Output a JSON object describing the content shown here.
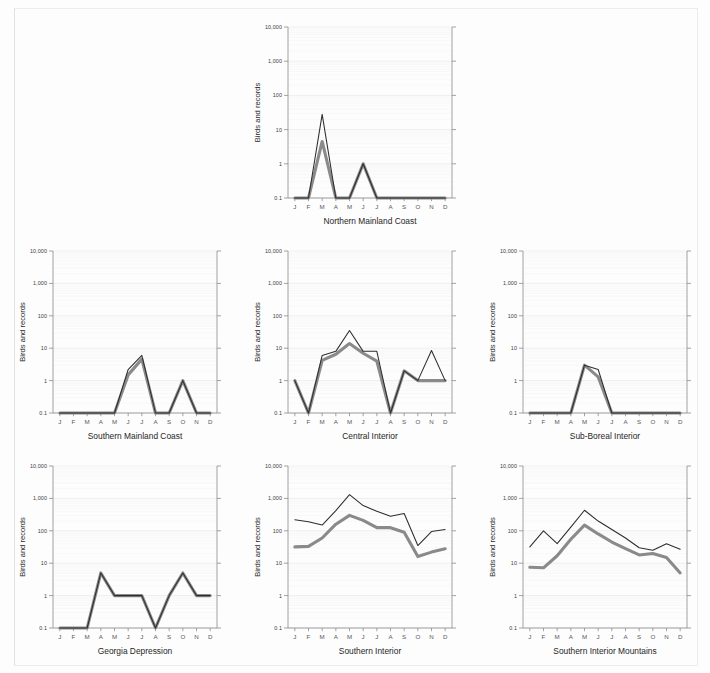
{
  "figure": {
    "y_axis_title": "Birds and records",
    "months": [
      "J",
      "F",
      "M",
      "A",
      "M",
      "J",
      "J",
      "A",
      "S",
      "O",
      "N",
      "D"
    ],
    "y_tick_labels": [
      "10,000",
      "1,000",
      "100",
      "10",
      "1",
      "0.1"
    ],
    "colors": {
      "background": "#fdfdfd",
      "records_line": "#2d2d2d",
      "birds_line": "#8a8a8a",
      "axis": "#8c8c8c",
      "grid_major": "#e9e9e9",
      "grid_minor": "#f4f4f4"
    }
  },
  "chart_data": [
    {
      "type": "line",
      "title": "Northern Mainland Coast",
      "xlabel": "",
      "ylabel": "Birds and records",
      "yscale": "log",
      "ylim": [
        0.1,
        10000
      ],
      "ytick_labels": [
        "10,000",
        "1,000",
        "100",
        "10",
        "1",
        "0.1"
      ],
      "yticks": [
        10000,
        1000,
        100,
        10,
        1,
        0.1
      ],
      "categories": [
        "J",
        "F",
        "M",
        "A",
        "M",
        "J",
        "J",
        "A",
        "S",
        "O",
        "N",
        "D"
      ],
      "grid": true,
      "legend": "none",
      "series": [
        {
          "name": "records",
          "style": "thin-dark",
          "values": [
            0.1,
            0.1,
            28,
            0.1,
            0.1,
            1,
            0.1,
            0.1,
            0.1,
            0.1,
            0.1,
            0.1
          ]
        },
        {
          "name": "birds",
          "style": "thick-gray",
          "values": [
            0.1,
            0.1,
            4.5,
            0.1,
            0.1,
            1,
            0.1,
            0.1,
            0.1,
            0.1,
            0.1,
            0.1
          ]
        }
      ]
    },
    {
      "type": "line",
      "title": "Southern Mainland Coast",
      "xlabel": "",
      "ylabel": "Birds and records",
      "yscale": "log",
      "ylim": [
        0.1,
        10000
      ],
      "ytick_labels": [
        "10,000",
        "1,000",
        "100",
        "10",
        "1",
        "0.1"
      ],
      "yticks": [
        10000,
        1000,
        100,
        10,
        1,
        0.1
      ],
      "categories": [
        "J",
        "F",
        "M",
        "A",
        "M",
        "J",
        "J",
        "A",
        "S",
        "O",
        "N",
        "D"
      ],
      "grid": true,
      "legend": "none",
      "series": [
        {
          "name": "records",
          "style": "thin-dark",
          "values": [
            0.1,
            0.1,
            0.1,
            0.1,
            0.1,
            2.2,
            6,
            0.1,
            0.1,
            1,
            0.1,
            0.1
          ]
        },
        {
          "name": "birds",
          "style": "thick-gray",
          "values": [
            0.1,
            0.1,
            0.1,
            0.1,
            0.1,
            1.5,
            4.6,
            0.1,
            0.1,
            1,
            0.1,
            0.1
          ]
        }
      ]
    },
    {
      "type": "line",
      "title": "Central Interior",
      "xlabel": "",
      "ylabel": "Birds and records",
      "yscale": "log",
      "ylim": [
        0.1,
        10000
      ],
      "ytick_labels": [
        "10,000",
        "1,000",
        "100",
        "10",
        "1",
        "0.1"
      ],
      "yticks": [
        10000,
        1000,
        100,
        10,
        1,
        0.1
      ],
      "categories": [
        "J",
        "F",
        "M",
        "A",
        "M",
        "J",
        "J",
        "A",
        "S",
        "O",
        "N",
        "D"
      ],
      "grid": true,
      "legend": "none",
      "series": [
        {
          "name": "records",
          "style": "thin-dark",
          "values": [
            1,
            0.1,
            6,
            8,
            35,
            8,
            8,
            0.1,
            2,
            1,
            8.5,
            1
          ]
        },
        {
          "name": "birds",
          "style": "thick-gray",
          "values": [
            1,
            0.1,
            4.2,
            6.5,
            14,
            7,
            4,
            0.1,
            2,
            1,
            1,
            1
          ]
        }
      ]
    },
    {
      "type": "line",
      "title": "Sub-Boreal Interior",
      "xlabel": "",
      "ylabel": "Birds and records",
      "yscale": "log",
      "ylim": [
        0.1,
        10000
      ],
      "ytick_labels": [
        "10,000",
        "1,000",
        "100",
        "10",
        "1",
        "0.1"
      ],
      "yticks": [
        10000,
        1000,
        100,
        10,
        1,
        0.1
      ],
      "categories": [
        "J",
        "F",
        "M",
        "A",
        "M",
        "J",
        "J",
        "A",
        "S",
        "O",
        "N",
        "D"
      ],
      "grid": true,
      "legend": "none",
      "series": [
        {
          "name": "records",
          "style": "thin-dark",
          "values": [
            0.1,
            0.1,
            0.1,
            0.1,
            3,
            2.2,
            0.1,
            0.1,
            0.1,
            0.1,
            0.1,
            0.1
          ]
        },
        {
          "name": "birds",
          "style": "thick-gray",
          "values": [
            0.1,
            0.1,
            0.1,
            0.1,
            3,
            1.3,
            0.1,
            0.1,
            0.1,
            0.1,
            0.1,
            0.1
          ]
        }
      ]
    },
    {
      "type": "line",
      "title": "Georgia Depression",
      "xlabel": "",
      "ylabel": "Birds and records",
      "yscale": "log",
      "ylim": [
        0.1,
        10000
      ],
      "ytick_labels": [
        "10,000",
        "1,000",
        "100",
        "10",
        "1",
        "0.1"
      ],
      "yticks": [
        10000,
        1000,
        100,
        10,
        1,
        0.1
      ],
      "categories": [
        "J",
        "F",
        "M",
        "A",
        "M",
        "J",
        "J",
        "A",
        "S",
        "O",
        "N",
        "D"
      ],
      "grid": true,
      "legend": "none",
      "series": [
        {
          "name": "records",
          "style": "thin-dark",
          "values": [
            0.1,
            0.1,
            0.1,
            5,
            1,
            1,
            1,
            0.1,
            1,
            5,
            1,
            1
          ]
        },
        {
          "name": "birds",
          "style": "thick-gray",
          "values": [
            0.1,
            0.1,
            0.1,
            5,
            1,
            1,
            1,
            0.1,
            1,
            5,
            1,
            1
          ]
        }
      ]
    },
    {
      "type": "line",
      "title": "Southern Interior",
      "xlabel": "",
      "ylabel": "Birds and records",
      "yscale": "log",
      "ylim": [
        0.1,
        10000
      ],
      "ytick_labels": [
        "10,000",
        "1,000",
        "100",
        "10",
        "1",
        "0.1"
      ],
      "yticks": [
        10000,
        1000,
        100,
        10,
        1,
        0.1
      ],
      "categories": [
        "J",
        "F",
        "M",
        "A",
        "M",
        "J",
        "J",
        "A",
        "S",
        "O",
        "N",
        "D"
      ],
      "grid": true,
      "legend": "none",
      "series": [
        {
          "name": "records",
          "style": "thin-dark",
          "values": [
            220,
            190,
            150,
            420,
            1300,
            600,
            400,
            280,
            340,
            35,
            95,
            110
          ]
        },
        {
          "name": "birds",
          "style": "thick-gray",
          "values": [
            32,
            33,
            60,
            160,
            300,
            210,
            125,
            125,
            90,
            16,
            22,
            28
          ]
        }
      ]
    },
    {
      "type": "line",
      "title": "Southern Interior Mountains",
      "xlabel": "",
      "ylabel": "Birds and records",
      "yscale": "log",
      "ylim": [
        0.1,
        10000
      ],
      "ytick_labels": [
        "10,000",
        "1,000",
        "100",
        "10",
        "1",
        "0.1"
      ],
      "yticks": [
        10000,
        1000,
        100,
        10,
        1,
        0.1
      ],
      "categories": [
        "J",
        "F",
        "M",
        "A",
        "M",
        "J",
        "J",
        "A",
        "S",
        "O",
        "N",
        "D"
      ],
      "grid": true,
      "legend": "none",
      "series": [
        {
          "name": "records",
          "style": "thin-dark",
          "values": [
            32,
            100,
            40,
            130,
            430,
            200,
            110,
            60,
            30,
            25,
            40,
            27
          ]
        },
        {
          "name": "birds",
          "style": "thick-gray",
          "values": [
            7.5,
            7.2,
            17,
            55,
            150,
            80,
            45,
            28,
            18,
            20,
            15,
            5
          ]
        }
      ]
    }
  ],
  "layout": {
    "panels": [
      {
        "key": 0,
        "left": 251,
        "top": 14,
        "cell_w": 219,
        "cell_h": 224
      },
      {
        "key": 1,
        "left": 16,
        "top": 238,
        "cell_w": 219,
        "cell_h": 215
      },
      {
        "key": 2,
        "left": 251,
        "top": 238,
        "cell_w": 219,
        "cell_h": 215
      },
      {
        "key": 3,
        "left": 486,
        "top": 238,
        "cell_w": 219,
        "cell_h": 215
      },
      {
        "key": 4,
        "left": 16,
        "top": 453,
        "cell_w": 219,
        "cell_h": 215
      },
      {
        "key": 5,
        "left": 251,
        "top": 453,
        "cell_w": 219,
        "cell_h": 215
      },
      {
        "key": 6,
        "left": 486,
        "top": 453,
        "cell_w": 219,
        "cell_h": 215
      }
    ]
  }
}
